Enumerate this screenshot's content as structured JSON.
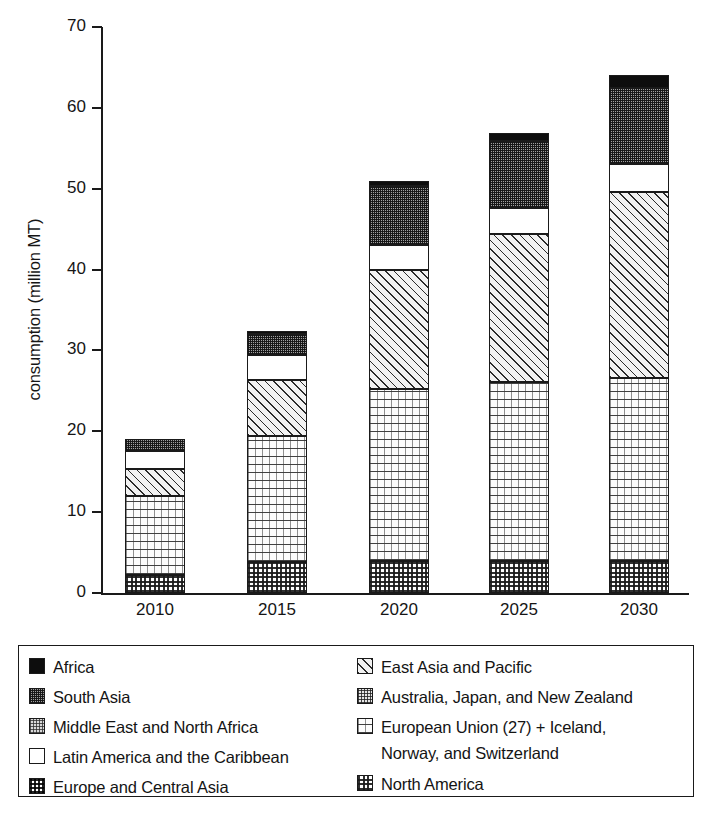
{
  "chart_data": {
    "type": "bar",
    "subtype": "stacked-vertical",
    "title": "",
    "xlabel": "",
    "ylabel": "consumption (million MT)",
    "categories": [
      "2010",
      "2015",
      "2020",
      "2025",
      "2030"
    ],
    "ylim": [
      0,
      70
    ],
    "yticks": [
      0,
      10,
      20,
      30,
      40,
      50,
      60,
      70
    ],
    "grid": false,
    "legend_position": "below-plot",
    "stack_order_bottom_to_top": [
      "North America",
      "European Union (27) + Iceland, Norway, and Switzerland",
      "Australia, Japan, and New Zealand",
      "East Asia and Pacific",
      "Europe and Central Asia",
      "Latin America and the Caribbean",
      "Middle East and North Africa",
      "South Asia",
      "Africa"
    ],
    "series": [
      {
        "name": "North America",
        "pattern": "checker-fine",
        "values": [
          2.2,
          3.8,
          4.0,
          4.0,
          4.0
        ]
      },
      {
        "name": "European Union (27) + Iceland, Norway, and Switzerland",
        "pattern": "dots-sparse",
        "values": [
          9.8,
          15.6,
          21.2,
          22.1,
          22.6
        ]
      },
      {
        "name": "East Asia and Pacific",
        "pattern": "diagonal-hatch",
        "values": [
          3.3,
          6.9,
          14.7,
          18.3,
          23.0
        ]
      },
      {
        "name": "Latin America and the Caribbean",
        "pattern": "solid-white",
        "values": [
          2.3,
          3.1,
          3.1,
          3.2,
          3.4
        ]
      },
      {
        "name": "South Asia",
        "pattern": "speckle-dark",
        "values": [
          1.5,
          2.6,
          7.3,
          8.3,
          9.5
        ]
      },
      {
        "name": "Africa",
        "pattern": "solid-black",
        "values": [
          0.0,
          0.4,
          0.6,
          1.0,
          1.6
        ]
      }
    ],
    "totals": [
      19.1,
      32.4,
      50.9,
      56.9,
      64.1
    ]
  },
  "axis": {
    "y_title": "consumption (million MT)",
    "y_tick_labels": [
      "0",
      "10",
      "20",
      "30",
      "40",
      "50",
      "60",
      "70"
    ],
    "x_tick_labels": [
      "2010",
      "2015",
      "2020",
      "2025",
      "2030"
    ]
  },
  "legend": {
    "left_column": [
      {
        "label": "Africa",
        "pattern": "solid-black"
      },
      {
        "label": "South Asia",
        "pattern": "speckle-dark"
      },
      {
        "label": "Middle East and North Africa",
        "pattern": "speckle-mid"
      },
      {
        "label": "Latin America and the Caribbean",
        "pattern": "solid-white"
      },
      {
        "label": "Europe and Central Asia",
        "pattern": "checker-coarse"
      }
    ],
    "right_column": [
      {
        "label": "East Asia and Pacific",
        "pattern": "diagonal-hatch"
      },
      {
        "label": "Australia, Japan, and New Zealand",
        "pattern": "speckle-light"
      },
      {
        "label": "European Union (27) + Iceland,\nNorway, and Switzerland",
        "pattern": "dots-sparse"
      },
      {
        "label": "North America",
        "pattern": "checker-fine"
      }
    ]
  },
  "colors": {
    "axis": "#1a1a1a",
    "text": "#141414",
    "background": "#ffffff",
    "africa": "#0d0d0d",
    "south_asia": "#707070",
    "mena": "#c9c9c9",
    "latin_america": "#ffffff"
  }
}
